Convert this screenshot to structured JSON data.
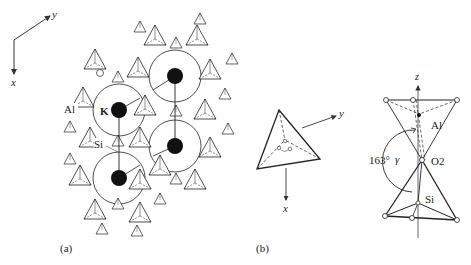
{
  "panels": {
    "a": {
      "label": "(a)",
      "axes": {
        "y_label": "y",
        "x_label": "x"
      },
      "atom_labels": {
        "al": "Al",
        "k": "K",
        "si": "Si"
      }
    },
    "b": {
      "label": "(b)",
      "axes": {
        "y_label": "y",
        "x_label": "x"
      }
    },
    "c": {
      "axis_label": "z",
      "atom_labels": {
        "al": "Al",
        "o2": "O2",
        "si": "Si"
      },
      "angle_value": "163°",
      "angle_symbol": "γ"
    }
  },
  "colors": {
    "line": "#222222",
    "atom_fill": "#111111",
    "background": "#ffffff"
  }
}
